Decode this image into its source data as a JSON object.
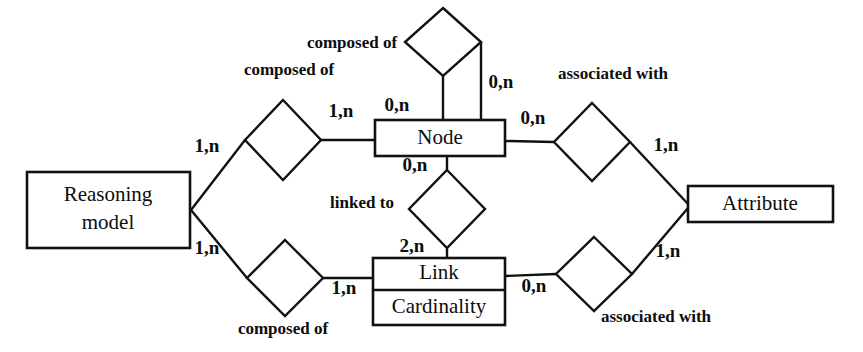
{
  "diagram": {
    "type": "entity-relationship-diagram",
    "notation": "merise-min-max",
    "background_color": "#ffffff",
    "line_color": "#111111",
    "text_color": "#0d0d0d",
    "entities": [
      {
        "id": "reasoning-model",
        "name": "Reasoning model",
        "line1": "Reasoning",
        "line2": "model",
        "x": 27,
        "y": 172,
        "w": 163,
        "h": 76
      },
      {
        "id": "node",
        "name": "Node",
        "x": 375,
        "y": 120,
        "w": 130,
        "h": 36
      },
      {
        "id": "link",
        "name": "Link",
        "attribute": "Cardinality",
        "x": 373,
        "y": 258,
        "w": 132,
        "h": 67
      },
      {
        "id": "attribute",
        "name": "Attribute",
        "x": 688,
        "y": 186,
        "w": 145,
        "h": 36
      }
    ],
    "relationships": [
      {
        "id": "node-composed-of",
        "label": "composed of",
        "cx": 443,
        "cy": 42,
        "rx": 38,
        "ry": 34
      },
      {
        "id": "model-composed-of-node",
        "label": "composed of",
        "cx": 283,
        "cy": 140,
        "rx": 38,
        "ry": 40
      },
      {
        "id": "node-associated-with",
        "label": "associated with",
        "cx": 592,
        "cy": 142,
        "rx": 38,
        "ry": 39
      },
      {
        "id": "node-linked-to",
        "label": "linked to",
        "cx": 447,
        "cy": 209,
        "rx": 38,
        "ry": 39
      },
      {
        "id": "model-composed-of-link",
        "label": "composed of",
        "cx": 285,
        "cy": 278,
        "rx": 38,
        "ry": 38
      },
      {
        "id": "link-associated-with",
        "label": "associated with",
        "cx": 594,
        "cy": 274,
        "rx": 38,
        "ry": 37
      }
    ],
    "cardinalities": [
      {
        "id": "card-node-composed-left",
        "text": "0,n",
        "x": 397,
        "y": 107
      },
      {
        "id": "card-node-composed-right",
        "text": "0,n",
        "x": 501,
        "y": 84
      },
      {
        "id": "card-model-composed-node-left",
        "text": "1,n",
        "x": 207,
        "y": 148
      },
      {
        "id": "card-model-composed-node-right",
        "text": "1,n",
        "x": 341,
        "y": 113
      },
      {
        "id": "card-node-assoc-left",
        "text": "0,n",
        "x": 533,
        "y": 120
      },
      {
        "id": "card-node-assoc-right",
        "text": "1,n",
        "x": 666,
        "y": 147
      },
      {
        "id": "card-node-linked-top",
        "text": "0,n",
        "x": 415,
        "y": 167
      },
      {
        "id": "card-link-linked-bottom",
        "text": "2,n",
        "x": 412,
        "y": 248
      },
      {
        "id": "card-model-composed-link-left",
        "text": "1,n",
        "x": 207,
        "y": 250
      },
      {
        "id": "card-model-composed-link-right",
        "text": "1,n",
        "x": 344,
        "y": 290
      },
      {
        "id": "card-link-assoc-left",
        "text": "0,n",
        "x": 534,
        "y": 288
      },
      {
        "id": "card-link-assoc-right",
        "text": "1,n",
        "x": 668,
        "y": 253
      }
    ],
    "relationship_label_positions": [
      {
        "id": "label-node-composed-of",
        "text": "composed of",
        "x": 352,
        "y": 44
      },
      {
        "id": "label-model-composed-of-node",
        "text": "composed of",
        "x": 289,
        "y": 71
      },
      {
        "id": "label-node-associated-with",
        "text": "associated with",
        "x": 613,
        "y": 75
      },
      {
        "id": "label-node-linked-to",
        "text": "linked to",
        "x": 362,
        "y": 204
      },
      {
        "id": "label-model-composed-of-link",
        "text": "composed of",
        "x": 283,
        "y": 330
      },
      {
        "id": "label-link-associated-with",
        "text": "associated with",
        "x": 656,
        "y": 318
      }
    ]
  }
}
